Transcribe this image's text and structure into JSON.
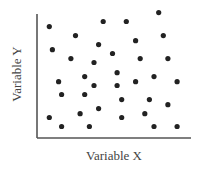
{
  "chart_data": {
    "type": "scatter",
    "title": "",
    "xlabel": "Variable X",
    "ylabel": "Variable Y",
    "xlim": [
      0,
      10
    ],
    "ylim": [
      0,
      10
    ],
    "grid": false,
    "legend": null,
    "ticks": {
      "x": [],
      "y": []
    },
    "marker_color": "#222222",
    "axis_color": "#555555",
    "series": [
      {
        "name": "points",
        "points": [
          {
            "x": 7.9,
            "y": 9.8
          },
          {
            "x": 0.8,
            "y": 8.7
          },
          {
            "x": 4.3,
            "y": 9.1
          },
          {
            "x": 5.8,
            "y": 9.1
          },
          {
            "x": 2.5,
            "y": 8.0
          },
          {
            "x": 8.2,
            "y": 8.0
          },
          {
            "x": 6.4,
            "y": 7.6
          },
          {
            "x": 1.0,
            "y": 6.9
          },
          {
            "x": 4.0,
            "y": 7.3
          },
          {
            "x": 4.9,
            "y": 6.6
          },
          {
            "x": 2.2,
            "y": 6.2
          },
          {
            "x": 3.7,
            "y": 5.9
          },
          {
            "x": 6.7,
            "y": 6.2
          },
          {
            "x": 8.5,
            "y": 6.2
          },
          {
            "x": 5.2,
            "y": 5.1
          },
          {
            "x": 1.4,
            "y": 4.4
          },
          {
            "x": 3.1,
            "y": 4.8
          },
          {
            "x": 6.4,
            "y": 4.4
          },
          {
            "x": 7.6,
            "y": 4.8
          },
          {
            "x": 9.1,
            "y": 4.4
          },
          {
            "x": 3.7,
            "y": 4.1
          },
          {
            "x": 5.2,
            "y": 4.1
          },
          {
            "x": 1.6,
            "y": 3.4
          },
          {
            "x": 3.1,
            "y": 3.4
          },
          {
            "x": 5.5,
            "y": 3.0
          },
          {
            "x": 7.3,
            "y": 3.0
          },
          {
            "x": 8.5,
            "y": 2.6
          },
          {
            "x": 4.0,
            "y": 2.3
          },
          {
            "x": 2.8,
            "y": 1.9
          },
          {
            "x": 7.0,
            "y": 1.9
          },
          {
            "x": 0.8,
            "y": 1.6
          },
          {
            "x": 5.5,
            "y": 1.6
          },
          {
            "x": 1.6,
            "y": 0.9
          },
          {
            "x": 3.4,
            "y": 0.9
          },
          {
            "x": 7.6,
            "y": 0.9
          },
          {
            "x": 9.1,
            "y": 0.9
          }
        ]
      }
    ]
  }
}
